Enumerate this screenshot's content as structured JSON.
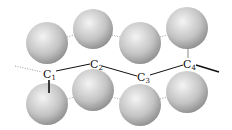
{
  "diagram": {
    "type": "molecular chain",
    "atoms": [
      {
        "label": "C",
        "sub": "1"
      },
      {
        "label": "C",
        "sub": "2"
      },
      {
        "label": "C",
        "sub": "3"
      },
      {
        "label": "C",
        "sub": "4"
      }
    ],
    "sphere_color": "#c8c8c8"
  }
}
